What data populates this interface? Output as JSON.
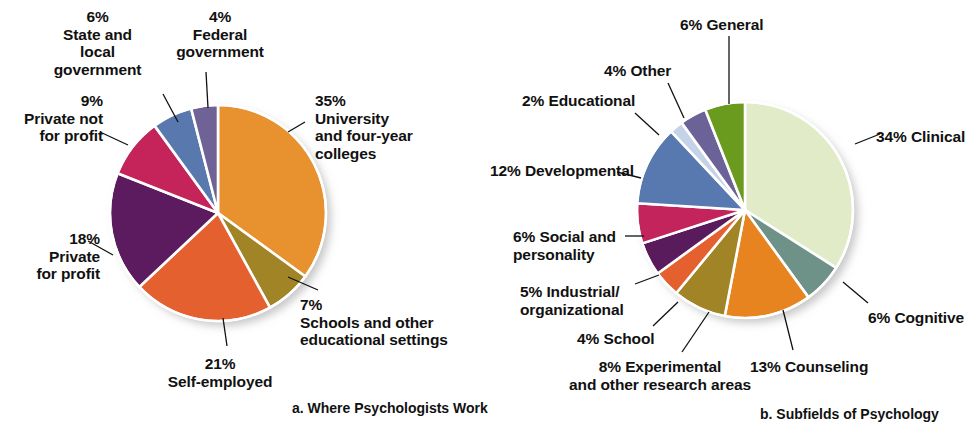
{
  "figure": {
    "background": "#ffffff",
    "text_color": "#111111"
  },
  "charts": [
    {
      "id": "where-psychologists-work",
      "caption": "a. Where Psychologists Work",
      "caption_x": 292,
      "caption_y": 400,
      "cx": 218,
      "cy": 213,
      "r": 108,
      "chart_data": {
        "type": "pie",
        "title": "a. Where Psychologists Work",
        "start_angle_deg": 0,
        "direction": "clockwise",
        "units": "percent",
        "categories": [
          "University and four-year colleges",
          "Schools and other educational settings",
          "Self-employed",
          "Private for profit",
          "Private not for profit",
          "State and local government",
          "Federal government"
        ],
        "values": [
          35,
          7,
          21,
          18,
          9,
          6,
          4
        ],
        "colors": [
          "#E8912F",
          "#A08425",
          "#E4602F",
          "#5C1B5E",
          "#C4245A",
          "#5878AE",
          "#6F6396"
        ]
      },
      "slices": [
        {
          "name": "university",
          "pct": 35,
          "color": "#E8912F"
        },
        {
          "name": "schools",
          "pct": 7,
          "color": "#A08425"
        },
        {
          "name": "self-employed",
          "pct": 21,
          "color": "#E4602F"
        },
        {
          "name": "private-for-profit",
          "pct": 18,
          "color": "#5C1B5E"
        },
        {
          "name": "private-not-for-profit",
          "pct": 9,
          "color": "#C4245A"
        },
        {
          "name": "state-local-government",
          "pct": 6,
          "color": "#5878AE"
        },
        {
          "name": "federal-government",
          "pct": 4,
          "color": "#6F6396"
        }
      ],
      "labels": [
        {
          "key": "university",
          "text": "35%\nUniversity\nand four-year\ncolleges",
          "x": 315,
          "y": 92,
          "align": "l",
          "w": 150
        },
        {
          "key": "schools",
          "text": "7%\nSchools and other\neducational settings",
          "x": 300,
          "y": 296,
          "align": "l",
          "w": 180
        },
        {
          "key": "self_employed",
          "text": "21%\nSelf-employed",
          "x": 140,
          "y": 355,
          "align": "c",
          "w": 160
        },
        {
          "key": "private_for_profit",
          "text": "18%\nPrivate\nfor profit",
          "x": 10,
          "y": 230,
          "align": "r",
          "w": 90
        },
        {
          "key": "private_not_for_profit",
          "text": "9%\nPrivate not\nfor profit",
          "x": 8,
          "y": 92,
          "align": "r",
          "w": 95
        },
        {
          "key": "state_local",
          "text": "6%\nState and\nlocal\ngovernment",
          "x": 45,
          "y": 8,
          "align": "c",
          "w": 105
        },
        {
          "key": "federal",
          "text": "4%\nFederal\ngovernment",
          "x": 165,
          "y": 8,
          "align": "c",
          "w": 110
        }
      ],
      "leaders": [
        {
          "key": "university",
          "x1": 288,
          "y1": 132,
          "x2": 305,
          "y2": 122
        },
        {
          "key": "schools",
          "x1": 288,
          "y1": 277,
          "x2": 318,
          "y2": 290
        },
        {
          "key": "self_employed",
          "x1": 223,
          "y1": 318,
          "x2": 227,
          "y2": 346
        },
        {
          "key": "private_for_profit",
          "x1": 113,
          "y1": 255,
          "x2": 88,
          "y2": 241
        },
        {
          "key": "private_not_for_profit",
          "x1": 128,
          "y1": 145,
          "x2": 100,
          "y2": 132
        },
        {
          "key": "state_local",
          "x1": 178,
          "y1": 122,
          "x2": 163,
          "y2": 94
        },
        {
          "key": "federal",
          "x1": 208,
          "y1": 108,
          "x2": 206,
          "y2": 72
        }
      ]
    },
    {
      "id": "subfields-of-psychology",
      "caption": "b. Subfields of Psychology",
      "caption_x": 760,
      "caption_y": 406,
      "cx": 745,
      "cy": 210,
      "r": 108,
      "chart_data": {
        "type": "pie",
        "title": "b. Subfields of Psychology",
        "start_angle_deg": 0,
        "direction": "clockwise",
        "units": "percent",
        "categories": [
          "Clinical",
          "Cognitive",
          "Counseling",
          "Experimental and other research areas",
          "School",
          "Industrial/organizational",
          "Social and personality",
          "Developmental",
          "Educational",
          "Other",
          "General"
        ],
        "values": [
          34,
          6,
          13,
          8,
          4,
          5,
          6,
          12,
          2,
          4,
          6
        ],
        "colors": [
          "#E2EBC8",
          "#6E9288",
          "#E8841F",
          "#A08425",
          "#E4612F",
          "#5A1B5C",
          "#C3245C",
          "#5879B0",
          "#C5D3E8",
          "#6B6398",
          "#6A9A1E"
        ]
      },
      "slices": [
        {
          "name": "clinical",
          "pct": 34,
          "color": "#E2EBC8"
        },
        {
          "name": "cognitive",
          "pct": 6,
          "color": "#6E9288"
        },
        {
          "name": "counseling",
          "pct": 13,
          "color": "#E8841F"
        },
        {
          "name": "experimental",
          "pct": 8,
          "color": "#A08425"
        },
        {
          "name": "school",
          "pct": 4,
          "color": "#E4612F"
        },
        {
          "name": "industrial-organizational",
          "pct": 5,
          "color": "#5A1B5C"
        },
        {
          "name": "social-personality",
          "pct": 6,
          "color": "#C3245C"
        },
        {
          "name": "developmental",
          "pct": 12,
          "color": "#5879B0"
        },
        {
          "name": "educational",
          "pct": 2,
          "color": "#C5D3E8"
        },
        {
          "name": "other",
          "pct": 4,
          "color": "#6B6398"
        },
        {
          "name": "general",
          "pct": 6,
          "color": "#6A9A1E"
        }
      ],
      "labels": [
        {
          "key": "clinical",
          "text": "34% Clinical",
          "x": 876,
          "y": 128,
          "align": "l",
          "w": 110
        },
        {
          "key": "cognitive",
          "text": "6% Cognitive",
          "x": 868,
          "y": 309,
          "align": "l",
          "w": 110
        },
        {
          "key": "counseling",
          "text": "13% Counseling",
          "x": 750,
          "y": 358,
          "align": "l",
          "w": 130
        },
        {
          "key": "experimental",
          "text": "8% Experimental\nand other research areas",
          "x": 565,
          "y": 358,
          "align": "c",
          "w": 190
        },
        {
          "key": "school",
          "text": "4% School",
          "x": 577,
          "y": 330,
          "align": "l",
          "w": 90
        },
        {
          "key": "industrial",
          "text": "5% Industrial/\norganizational",
          "x": 520,
          "y": 283,
          "align": "l",
          "w": 130
        },
        {
          "key": "social",
          "text": "6% Social and\npersonality",
          "x": 513,
          "y": 228,
          "align": "l",
          "w": 125
        },
        {
          "key": "developmental",
          "text": "12% Developmental",
          "x": 490,
          "y": 162,
          "align": "l",
          "w": 160
        },
        {
          "key": "educational",
          "text": "2% Educational",
          "x": 522,
          "y": 92,
          "align": "l",
          "w": 125
        },
        {
          "key": "other",
          "text": "4% Other",
          "x": 604,
          "y": 62,
          "align": "l",
          "w": 85
        },
        {
          "key": "general",
          "text": "6% General",
          "x": 680,
          "y": 16,
          "align": "l",
          "w": 100
        }
      ],
      "leaders": [
        {
          "key": "clinical",
          "x1": 855,
          "y1": 144,
          "x2": 880,
          "y2": 134
        },
        {
          "key": "cognitive",
          "x1": 843,
          "y1": 282,
          "x2": 868,
          "y2": 303
        },
        {
          "key": "counseling",
          "x1": 783,
          "y1": 310,
          "x2": 793,
          "y2": 350
        },
        {
          "key": "experimental",
          "x1": 709,
          "y1": 312,
          "x2": 682,
          "y2": 352
        },
        {
          "key": "school",
          "x1": 678,
          "y1": 302,
          "x2": 653,
          "y2": 326
        },
        {
          "key": "industrial",
          "x1": 659,
          "y1": 275,
          "x2": 635,
          "y2": 284
        },
        {
          "key": "social",
          "x1": 644,
          "y1": 236,
          "x2": 625,
          "y2": 236
        },
        {
          "key": "developmental",
          "x1": 641,
          "y1": 178,
          "x2": 617,
          "y2": 172
        },
        {
          "key": "educational",
          "x1": 659,
          "y1": 135,
          "x2": 635,
          "y2": 113
        },
        {
          "key": "other",
          "x1": 684,
          "y1": 118,
          "x2": 668,
          "y2": 83
        },
        {
          "key": "general",
          "x1": 729,
          "y1": 104,
          "x2": 729,
          "y2": 36
        }
      ]
    }
  ]
}
